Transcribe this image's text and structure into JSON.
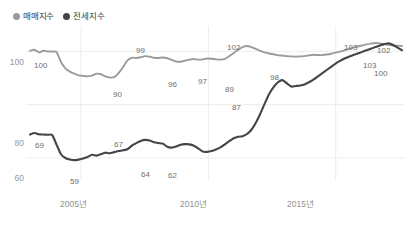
{
  "chart_data": {
    "type": "line",
    "title": "",
    "xlabel": "",
    "ylabel": "",
    "ylim": [
      54,
      108
    ],
    "xlim": [
      2003.0,
      2017.6
    ],
    "grid": true,
    "legend_position": "top-left",
    "y_ticks": [
      "100",
      "80",
      "60"
    ],
    "y_tick_values": [
      100,
      80,
      60
    ],
    "x_ticks": [
      "2005년",
      "2010년",
      "2015년"
    ],
    "x_tick_values": [
      2005,
      2010,
      2015
    ],
    "series": [
      {
        "name": "매매지수",
        "color": "#9b9b9b",
        "values": [
          100.2,
          100.6,
          99.6,
          100.2,
          100.0,
          99.9,
          99.7,
          96.0,
          93.6,
          92.4,
          91.6,
          91.0,
          90.8,
          90.6,
          90.9,
          91.6,
          91.4,
          90.6,
          90.2,
          90.3,
          91.8,
          94.0,
          96.6,
          97.6,
          97.5,
          97.8,
          98.2,
          98.0,
          97.6,
          97.5,
          97.7,
          97.4,
          96.8,
          96.2,
          96.1,
          96.5,
          96.9,
          97.1,
          96.9,
          97.0,
          97.3,
          97.2,
          97.0,
          96.9,
          97.2,
          98.2,
          99.4,
          100.6,
          101.6,
          102.0,
          101.6,
          100.9,
          100.2,
          99.6,
          99.2,
          98.9,
          98.6,
          98.4,
          98.2,
          98.1,
          98.0,
          98.1,
          98.2,
          98.5,
          98.7,
          98.6,
          98.6,
          98.8,
          99.1,
          99.5,
          99.9,
          100.4,
          100.9,
          101.4,
          101.8,
          102.2,
          102.6,
          102.9,
          103.1,
          103.0,
          102.7,
          102.4,
          102.2,
          102.1,
          102.0
        ]
      },
      {
        "name": "전세지수",
        "color": "#454545",
        "values": [
          68.8,
          69.4,
          68.9,
          68.8,
          68.7,
          68.6,
          65.0,
          61.4,
          60.0,
          59.4,
          59.2,
          59.4,
          59.8,
          60.4,
          61.2,
          60.9,
          61.4,
          62.0,
          61.8,
          62.2,
          62.6,
          62.9,
          63.3,
          64.6,
          65.6,
          66.4,
          66.8,
          66.6,
          65.9,
          65.6,
          65.4,
          64.2,
          63.9,
          64.3,
          65.0,
          65.2,
          65.1,
          64.6,
          63.6,
          62.4,
          62.3,
          62.6,
          63.2,
          64.0,
          65.1,
          66.3,
          67.4,
          68.0,
          68.2,
          69.0,
          70.6,
          73.2,
          76.6,
          80.4,
          84.0,
          86.6,
          88.4,
          89.2,
          88.0,
          86.8,
          87.0,
          87.2,
          87.6,
          88.4,
          89.4,
          90.6,
          91.8,
          93.0,
          94.2,
          95.4,
          96.4,
          97.3,
          98.0,
          98.6,
          99.2,
          99.8,
          100.4,
          101.0,
          101.6,
          102.2,
          102.7,
          103.0,
          102.4,
          101.4,
          100.4
        ]
      }
    ],
    "point_labels": [
      {
        "series": "매매지수",
        "text": "100",
        "x": 34,
        "y": 62
      },
      {
        "series": "매매지수",
        "text": "90",
        "x": 113,
        "y": 91
      },
      {
        "series": "매매지수",
        "text": "99",
        "x": 136,
        "y": 47
      },
      {
        "series": "매매지수",
        "text": "96",
        "x": 168,
        "y": 81
      },
      {
        "series": "매매지수",
        "text": "97",
        "x": 198,
        "y": 78
      },
      {
        "series": "매매지수",
        "text": "102",
        "x": 227,
        "y": 44
      },
      {
        "series": "전세지수",
        "text": "69",
        "x": 35,
        "y": 142
      },
      {
        "series": "전세지수",
        "text": "59",
        "x": 70,
        "y": 178
      },
      {
        "series": "전세지수",
        "text": "67",
        "x": 114,
        "y": 141
      },
      {
        "series": "전세지수",
        "text": "64",
        "x": 141,
        "y": 171
      },
      {
        "series": "전세지수",
        "text": "62",
        "x": 168,
        "y": 172
      },
      {
        "series": "전세지수",
        "text": "87",
        "x": 232,
        "y": 104
      },
      {
        "series": "전세지수",
        "text": "89",
        "x": 225,
        "y": 86
      },
      {
        "series": "전세지수",
        "text": "98",
        "x": 270,
        "y": 74
      },
      {
        "series": "전세지수",
        "text": "103",
        "x": 344,
        "y": 44
      },
      {
        "series": "매매지수",
        "text": "102",
        "x": 377,
        "y": 47
      },
      {
        "series": "매매지수",
        "text": "103",
        "x": 363,
        "y": 62
      },
      {
        "series": "전세지수",
        "text": "100",
        "x": 374,
        "y": 70
      }
    ]
  },
  "legend": {
    "items": [
      {
        "label": "매매지수",
        "color": "#9b9b9b"
      },
      {
        "label": "전세지수",
        "color": "#454545"
      }
    ]
  },
  "axes": {
    "y": [
      {
        "label": "100",
        "top": 58
      },
      {
        "label": "80",
        "top": 139
      },
      {
        "label": "60",
        "top": 174
      }
    ],
    "x": [
      {
        "label": "2005년",
        "left": 60
      },
      {
        "label": "2010년",
        "left": 180
      },
      {
        "label": "2015년",
        "left": 287
      }
    ]
  },
  "colors": {
    "background": "#ffffff",
    "grid": "#ededed",
    "axis_text": "#9a9a9a",
    "data_label": "#6e6e6e",
    "sale_line": "#9b9b9b",
    "lease_line": "#454545"
  }
}
